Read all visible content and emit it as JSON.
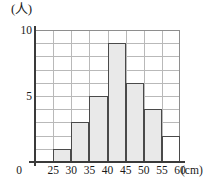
{
  "chart_data": {
    "type": "bar",
    "title": "",
    "subtitle": "",
    "xlabel": "(cm)",
    "ylabel": "(人)",
    "grid": true,
    "legend": false,
    "bin_width": 5,
    "xlim": [
      20,
      60
    ],
    "ylim": [
      0,
      10
    ],
    "x_tick_labels": [
      "0",
      "25",
      "30",
      "35",
      "40",
      "45",
      "50",
      "55",
      "60"
    ],
    "y_tick_labels": [
      "5",
      "10"
    ],
    "y_tick_values": [
      5,
      10
    ],
    "categories": [
      "20-25",
      "25-30",
      "30-35",
      "35-40",
      "40-45",
      "45-50",
      "50-55",
      "55-60"
    ],
    "values": [
      0,
      1,
      3,
      5,
      9,
      6,
      4,
      2
    ],
    "bars": [
      {
        "bin": "20-25",
        "start": 20,
        "end": 25,
        "value": 0,
        "filled": false
      },
      {
        "bin": "25-30",
        "start": 25,
        "end": 30,
        "value": 1,
        "filled": true
      },
      {
        "bin": "30-35",
        "start": 30,
        "end": 35,
        "value": 3,
        "filled": true
      },
      {
        "bin": "35-40",
        "start": 35,
        "end": 40,
        "value": 5,
        "filled": true
      },
      {
        "bin": "40-45",
        "start": 40,
        "end": 45,
        "value": 9,
        "filled": true
      },
      {
        "bin": "45-50",
        "start": 45,
        "end": 50,
        "value": 6,
        "filled": true
      },
      {
        "bin": "50-55",
        "start": 50,
        "end": 55,
        "value": 4,
        "filled": true
      },
      {
        "bin": "55-60",
        "start": 55,
        "end": 60,
        "value": 2,
        "filled": false
      }
    ],
    "colors": {
      "bar_fill": "#e9e9e9",
      "bar_edge": "#4a4a4a",
      "grid": "#b9b9b9",
      "axis": "#3a3a3a",
      "text": "#1a1a1a",
      "background": "#ffffff"
    }
  },
  "axis": {
    "y_unit_label": "(人)",
    "x_unit_label": "(cm)",
    "y_top_label": "10",
    "y_mid_label": "5"
  }
}
